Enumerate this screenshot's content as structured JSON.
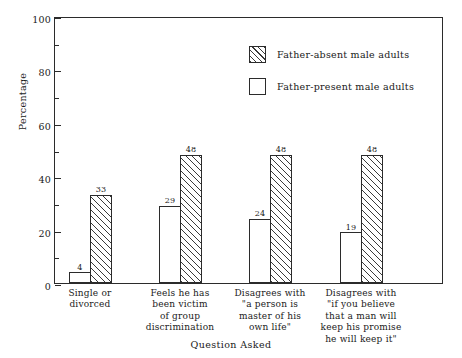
{
  "chart_data": {
    "type": "bar",
    "title": "",
    "xlabel": "Question Asked",
    "ylabel": "Percentage",
    "ylim": [
      0,
      100
    ],
    "ytick_major": [
      0,
      20,
      40,
      60,
      80,
      100
    ],
    "ytick_minor": [
      10,
      30,
      50,
      70,
      90
    ],
    "grid": false,
    "legend_position": "top-center",
    "bar_order": [
      "Father-present male adults",
      "Father-absent male adults"
    ],
    "categories": [
      "Single or\ndivorced",
      "Feels he has\nbeen victim\nof group\ndiscrimination",
      "Disagrees with\n\"a person is\nmaster of his\nown life\"",
      "Disagrees with\n\"if you believe\nthat a man will\nkeep his promise\nhe will keep it\""
    ],
    "series": [
      {
        "name": "Father-present male adults",
        "fill": "white",
        "values": [
          4,
          29,
          24,
          19
        ]
      },
      {
        "name": "Father-absent male adults",
        "fill": "hatched",
        "values": [
          33,
          48,
          48,
          48
        ]
      }
    ],
    "value_labels": {
      "father_present": [
        "4",
        "29",
        "24",
        "19"
      ],
      "father_absent": [
        "33",
        "48",
        "48",
        "48"
      ]
    },
    "colors": {
      "axis": "#2b2b2b",
      "bar_outline": "#2b2b2b",
      "hatch": "#3a3a3a",
      "background": "#ffffff",
      "text": "#1a1a1a"
    }
  },
  "legend": {
    "items": [
      {
        "label": "Father-absent male adults",
        "fill": "hatched"
      },
      {
        "label": "Father-present male adults",
        "fill": "white"
      }
    ]
  },
  "axes": {
    "y_title": "Percentage",
    "x_title": "Question Asked",
    "y_labels": [
      "0",
      "20",
      "40",
      "60",
      "80",
      "100"
    ]
  }
}
